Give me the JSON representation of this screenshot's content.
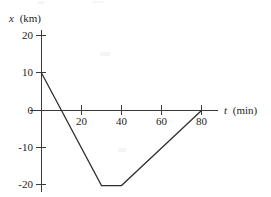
{
  "figure": {
    "background_color": "#ffffff",
    "line_color": "#2e2e2e",
    "axis_color": "#3a3a3a",
    "text_color": "#1c1c1c"
  },
  "axes": {
    "y_title_var": "x",
    "y_title_unit": "(km)",
    "y_title_full": "x (km)",
    "x_title_var": "t",
    "x_title_unit": "(min)",
    "x_title_full": "t (min)"
  },
  "ticks": {
    "y": [
      {
        "label": "20",
        "value": 20
      },
      {
        "label": "10",
        "value": 10
      },
      {
        "label": "0",
        "value": 0
      },
      {
        "label": "-10",
        "value": -10
      },
      {
        "label": "-20",
        "value": -20
      }
    ],
    "x": [
      {
        "label": "20",
        "value": 20
      },
      {
        "label": "40",
        "value": 40
      },
      {
        "label": "60",
        "value": 60
      },
      {
        "label": "80",
        "value": 80
      }
    ]
  },
  "chart_data": {
    "type": "line",
    "title": "",
    "subtitle": "",
    "xlabel": "t (min)",
    "ylabel": "x (km)",
    "xlim": [
      0,
      90
    ],
    "ylim": [
      -22,
      22
    ],
    "grid": false,
    "legend": false,
    "xticks": [
      20,
      40,
      60,
      80
    ],
    "yticks": [
      20,
      10,
      0,
      -10,
      -20
    ],
    "series": [
      {
        "name": "position",
        "x": [
          0,
          30,
          40,
          80
        ],
        "y": [
          10,
          -20,
          -20,
          0
        ],
        "points": [
          {
            "t": 0,
            "x": 10
          },
          {
            "t": 30,
            "x": -20
          },
          {
            "t": 40,
            "x": -20
          },
          {
            "t": 80,
            "x": 0
          }
        ],
        "color": "#2e2e2e",
        "zero_crossings": [
          10,
          80
        ],
        "segments": [
          {
            "from_t": 0,
            "to_t": 30,
            "from_x": 10,
            "to_x": -20,
            "slope_km_per_min": -1.0
          },
          {
            "from_t": 30,
            "to_t": 40,
            "from_x": -20,
            "to_x": -20,
            "slope_km_per_min": 0.0
          },
          {
            "from_t": 40,
            "to_t": 80,
            "from_x": -20,
            "to_x": 0,
            "slope_km_per_min": 0.5
          }
        ]
      }
    ]
  }
}
